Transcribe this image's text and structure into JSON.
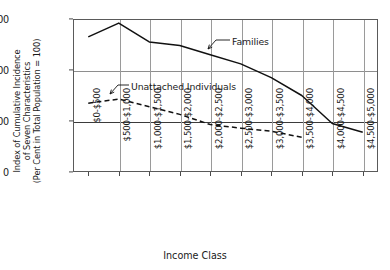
{
  "chart_data": {
    "type": "line",
    "title": "",
    "xlabel": "Income Class",
    "ylabel": "Index of Cumulative Incidence of Seven Characteristics (Per Cent in Total Population = 100)",
    "ylabel_lines": [
      "Index of Cumulative Incidence",
      "of Seven Characteristics",
      "(Per Cent in Total Population = 100)"
    ],
    "categories": [
      "$0-$500",
      "$500-$1,000",
      "$1,000-$1,500",
      "$1,500-$2,000",
      "$2,000-$2,500",
      "$2,500-$3,000",
      "$3,000-$3,500",
      "$3,500-$4,000",
      "$4,000-$4,500",
      "$4,500-$5,000"
    ],
    "yticks": [
      0,
      100,
      200,
      300
    ],
    "ytick_labels": [
      "0",
      "100",
      "200",
      "300"
    ],
    "ylim": [
      0,
      300
    ],
    "grid": "both",
    "reference_line": 100,
    "legend_position": "inline-annotation",
    "series": [
      {
        "name": "Families",
        "style": "solid",
        "color": "#111111",
        "values": [
          265,
          292,
          255,
          248,
          230,
          212,
          185,
          150,
          95,
          78
        ]
      },
      {
        "name": "Unattached Individuals",
        "style": "dashed",
        "color": "#111111",
        "values": [
          135,
          143,
          128,
          113,
          93,
          86,
          80,
          68,
          null,
          null
        ]
      }
    ],
    "annotations": [
      {
        "text": "Families",
        "target_series": "Families"
      },
      {
        "text": "Unattached Individuals",
        "target_series": "Unattached Individuals"
      }
    ]
  }
}
